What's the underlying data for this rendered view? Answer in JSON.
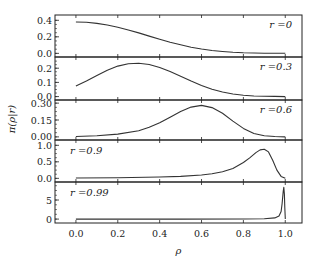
{
  "chart_data": {
    "type": "line",
    "layout": "5 vertically stacked panels sharing x axis",
    "xlabel": "ρ",
    "ylabel": "π(ρ|r)",
    "xlim": [
      -0.1,
      1.08
    ],
    "x_ticks": [
      "0.0",
      "0.2",
      "0.4",
      "0.6",
      "0.8",
      "1.0"
    ],
    "grid": false,
    "line_color": "#333333",
    "panels": [
      {
        "label": "r =0",
        "ylim": [
          -0.02,
          0.44
        ],
        "y_ticks": [
          "0.0",
          "0.2",
          "0.4"
        ],
        "label_pos": "top-right",
        "x": [
          0,
          0.05,
          0.1,
          0.15,
          0.2,
          0.25,
          0.3,
          0.35,
          0.4,
          0.45,
          0.5,
          0.55,
          0.6,
          0.65,
          0.7,
          0.75,
          0.8,
          0.85,
          0.9,
          0.95,
          1.0
        ],
        "y": [
          0.38,
          0.376,
          0.363,
          0.343,
          0.316,
          0.283,
          0.247,
          0.209,
          0.171,
          0.135,
          0.103,
          0.075,
          0.053,
          0.035,
          0.022,
          0.013,
          0.007,
          0.004,
          0.002,
          0.001,
          0.0
        ]
      },
      {
        "label": "r =0.3",
        "ylim": [
          -0.01,
          0.265
        ],
        "y_ticks": [
          "0.0",
          "0.1",
          "0.2"
        ],
        "label_pos": "top-right",
        "x": [
          0,
          0.05,
          0.1,
          0.15,
          0.2,
          0.25,
          0.3,
          0.35,
          0.4,
          0.45,
          0.5,
          0.55,
          0.6,
          0.65,
          0.7,
          0.75,
          0.8,
          0.85,
          0.9,
          0.95,
          1.0
        ],
        "y": [
          0.075,
          0.11,
          0.148,
          0.185,
          0.215,
          0.232,
          0.235,
          0.226,
          0.205,
          0.176,
          0.143,
          0.109,
          0.078,
          0.052,
          0.032,
          0.018,
          0.009,
          0.004,
          0.002,
          0.001,
          0.0
        ]
      },
      {
        "label": "r =0.6",
        "ylim": [
          -0.01,
          0.31
        ],
        "y_ticks": [
          "0.00",
          "0.15",
          "0.30"
        ],
        "label_pos": "top-right",
        "x": [
          0,
          0.1,
          0.2,
          0.3,
          0.35,
          0.4,
          0.45,
          0.5,
          0.55,
          0.6,
          0.65,
          0.7,
          0.75,
          0.8,
          0.85,
          0.9,
          0.95,
          1.0
        ],
        "y": [
          0.003,
          0.01,
          0.025,
          0.055,
          0.085,
          0.125,
          0.175,
          0.225,
          0.265,
          0.28,
          0.26,
          0.21,
          0.14,
          0.075,
          0.03,
          0.01,
          0.003,
          0.0
        ]
      },
      {
        "label": "r =0.9",
        "ylim": [
          -0.05,
          1.1
        ],
        "y_ticks": [
          "0.0",
          "0.5",
          "1.0"
        ],
        "label_pos": "top-left",
        "x": [
          0,
          0.2,
          0.4,
          0.5,
          0.6,
          0.65,
          0.7,
          0.75,
          0.8,
          0.83,
          0.86,
          0.88,
          0.9,
          0.92,
          0.94,
          0.96,
          0.98,
          1.0
        ],
        "y": [
          0.01,
          0.02,
          0.04,
          0.06,
          0.1,
          0.14,
          0.2,
          0.3,
          0.48,
          0.62,
          0.78,
          0.86,
          0.88,
          0.8,
          0.55,
          0.25,
          0.06,
          0.0
        ]
      },
      {
        "label": "r =0.99",
        "ylim": [
          -0.5,
          9.2
        ],
        "y_ticks": [
          "0",
          "5"
        ],
        "label_pos": "top-left",
        "x": [
          0,
          0.5,
          0.8,
          0.9,
          0.95,
          0.97,
          0.98,
          0.985,
          0.99,
          0.993,
          0.996,
          0.998,
          1.0
        ],
        "y": [
          0,
          0,
          0.02,
          0.08,
          0.3,
          0.8,
          2.0,
          4.0,
          7.2,
          8.3,
          6.5,
          3.0,
          0.0
        ]
      }
    ]
  },
  "labels": {
    "xlabel": "ρ",
    "ylabel": "π(ρ|r)"
  }
}
